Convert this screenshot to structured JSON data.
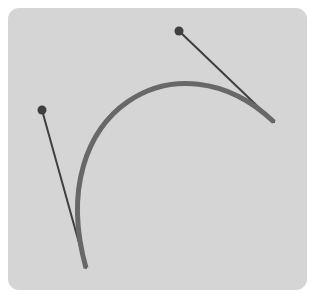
{
  "diagram": {
    "type": "cubic-bezier-curve",
    "colors": {
      "background": "#ffffff",
      "canvas": "#d5d5d5",
      "curve": "#686868",
      "handle_line": "#3f3f3f",
      "handle_point": "#3f3f3f"
    },
    "curve": {
      "start": [
        86,
        268
      ],
      "control1": [
        42,
        110
      ],
      "control2": [
        179,
        31
      ],
      "end": [
        274,
        122
      ],
      "stroke_width": 5
    },
    "handles": [
      {
        "name": "start-handle",
        "from": [
          86,
          268
        ],
        "to": [
          42,
          110
        ]
      },
      {
        "name": "end-handle",
        "from": [
          274,
          122
        ],
        "to": [
          179,
          31
        ]
      }
    ]
  }
}
